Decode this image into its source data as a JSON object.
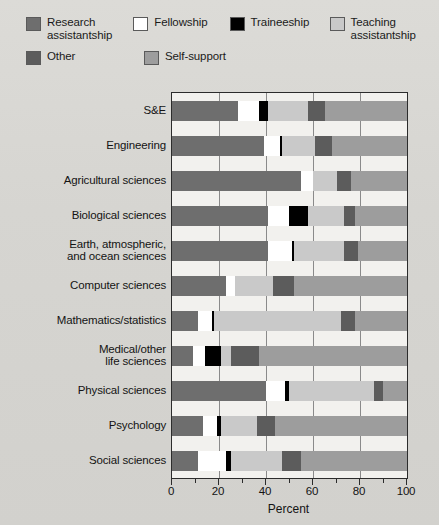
{
  "legend": {
    "items": [
      {
        "label": "Research assistantship",
        "color": "#6e6e6e",
        "key": "research-assistantship"
      },
      {
        "label": "Fellowship",
        "color": "#ffffff",
        "key": "fellowship"
      },
      {
        "label": "Traineeship",
        "color": "#000000",
        "key": "traineeship"
      },
      {
        "label": "Teaching assistantship",
        "color": "#c9c9c9",
        "key": "teaching-assistantship"
      },
      {
        "label": "Other",
        "color": "#5c5c5c",
        "key": "other"
      },
      {
        "label": "Self-support",
        "color": "#9d9d9d",
        "key": "self-support"
      }
    ]
  },
  "chart_data": {
    "type": "bar",
    "orientation": "horizontal",
    "stacked": true,
    "title": "",
    "xlabel": "Percent",
    "ylabel": "",
    "xlim": [
      0,
      100
    ],
    "xticks": [
      0,
      20,
      40,
      60,
      80,
      100
    ],
    "xticklabels": [
      "0",
      "20",
      "40",
      "60",
      "80",
      "100"
    ],
    "minor_ticks": [
      10,
      30,
      50,
      70,
      90
    ],
    "grid": false,
    "legend_position": "above",
    "categories": [
      "S&E",
      "Engineering",
      "Agricultural sciences",
      "Biological sciences",
      "Earth, atmospheric, and ocean sciences",
      "Computer sciences",
      "Mathematics/statistics",
      "Medical/other life sciences",
      "Physical sciences",
      "Psychology",
      "Social sciences"
    ],
    "category_label_lines": [
      [
        "S&E"
      ],
      [
        "Engineering"
      ],
      [
        "Agricultural sciences"
      ],
      [
        "Biological sciences"
      ],
      [
        "Earth, atmospheric,",
        "and ocean sciences"
      ],
      [
        "Computer sciences"
      ],
      [
        "Mathematics/statistics"
      ],
      [
        "Medical/other",
        "life sciences"
      ],
      [
        "Physical sciences"
      ],
      [
        "Psychology"
      ],
      [
        "Social sciences"
      ]
    ],
    "series": [
      {
        "name": "Research assistantship",
        "color": "#6e6e6e",
        "values": [
          28,
          39,
          55,
          41,
          41,
          23,
          11,
          9,
          40,
          13,
          11
        ]
      },
      {
        "name": "Fellowship",
        "color": "#ffffff",
        "values": [
          9,
          7,
          5,
          9,
          10,
          4,
          6,
          5,
          8,
          6,
          12
        ]
      },
      {
        "name": "Traineeship",
        "color": "#000000",
        "values": [
          4,
          1,
          0,
          8,
          1,
          0,
          1,
          7,
          2,
          2,
          2
        ]
      },
      {
        "name": "Teaching assistantship",
        "color": "#c9c9c9",
        "values": [
          17,
          14,
          10,
          15,
          21,
          16,
          54,
          4,
          36,
          15,
          22
        ]
      },
      {
        "name": "Other",
        "color": "#5c5c5c",
        "values": [
          7,
          7,
          6,
          5,
          6,
          9,
          6,
          12,
          4,
          8,
          8
        ]
      },
      {
        "name": "Self-support",
        "color": "#9d9d9d",
        "values": [
          35,
          32,
          24,
          22,
          21,
          48,
          22,
          63,
          10,
          56,
          45
        ]
      }
    ]
  }
}
